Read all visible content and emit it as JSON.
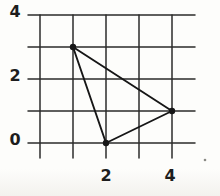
{
  "figure": {
    "background_color": "#fdfdfb",
    "grid_color": "#2b2b2b",
    "shape_color": "#161616",
    "label_color": "#1d1d1d",
    "grid": {
      "x_lines": [
        0,
        1,
        2,
        3,
        4
      ],
      "y_lines": [
        0,
        1,
        2,
        3,
        4
      ]
    },
    "x_axis": {
      "tick_labels": [
        {
          "text": "2",
          "value": 2
        },
        {
          "text": "4",
          "value": 4
        }
      ]
    },
    "y_axis": {
      "tick_labels": [
        {
          "text": "4",
          "value": 4
        },
        {
          "text": "2",
          "value": 2
        },
        {
          "text": "0",
          "value": 0
        }
      ]
    },
    "shape": {
      "type": "triangle",
      "vertices": [
        {
          "x": 1,
          "y": 3
        },
        {
          "x": 2,
          "y": 0
        },
        {
          "x": 4,
          "y": 1
        }
      ]
    },
    "stray_mark": {
      "present": true
    }
  },
  "chart_data": {
    "type": "scatter",
    "title": "",
    "xlabel": "",
    "ylabel": "",
    "xlim": [
      0,
      4
    ],
    "ylim": [
      0,
      4
    ],
    "grid": true,
    "x_ticks_labeled": [
      2,
      4
    ],
    "y_ticks_labeled": [
      0,
      2,
      4
    ],
    "series": [
      {
        "name": "triangle-vertices",
        "points": [
          [
            1,
            3
          ],
          [
            2,
            0
          ],
          [
            4,
            1
          ]
        ],
        "closed_polygon": true
      }
    ]
  }
}
